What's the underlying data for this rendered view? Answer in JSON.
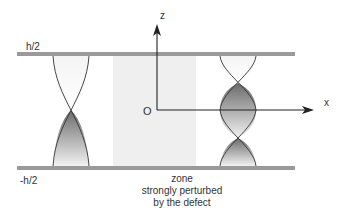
{
  "labels": {
    "top_plate": "h/2",
    "bottom_plate": "-h/2",
    "z_axis": "z",
    "x_axis": "x",
    "origin": "O"
  },
  "caption": {
    "line1": "zone",
    "line2": "strongly perturbed",
    "line3": "by the defect"
  },
  "colors": {
    "plate": "#9a9a9a",
    "zone": "#efefef",
    "axis": "#222222",
    "helix_line": "#333333"
  }
}
